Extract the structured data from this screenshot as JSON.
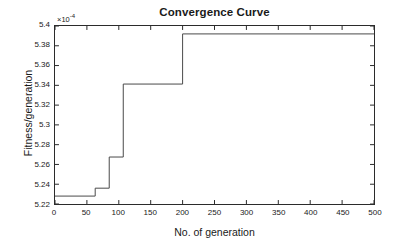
{
  "chart_data": {
    "type": "line",
    "variant": "step-post",
    "title": "Convergence Curve",
    "xlabel": "No. of generation",
    "ylabel": "Fitness/generation",
    "exponent_label": "×10",
    "exponent_power": "-4",
    "y_scale_factor": 0.0001,
    "xlim": [
      0,
      500
    ],
    "ylim": [
      5.22,
      5.4
    ],
    "grid": false,
    "legend": null,
    "line_color": "#4a4a4a",
    "xticks": [
      0,
      50,
      100,
      150,
      200,
      250,
      300,
      350,
      400,
      450,
      500
    ],
    "xtick_labels": [
      "0",
      "50",
      "100",
      "150",
      "200",
      "250",
      "300",
      "350",
      "400",
      "450",
      "500"
    ],
    "yticks": [
      5.22,
      5.24,
      5.26,
      5.28,
      5.3,
      5.32,
      5.34,
      5.36,
      5.38,
      5.4
    ],
    "ytick_labels": [
      "5.22",
      "5.24",
      "5.26",
      "5.28",
      "5.3",
      "5.32",
      "5.34",
      "5.36",
      "5.38",
      "5.4"
    ],
    "x": [
      0,
      63,
      63,
      85,
      85,
      107,
      107,
      200,
      200,
      500
    ],
    "y": [
      5.228,
      5.228,
      5.236,
      5.236,
      5.2675,
      5.2675,
      5.3413,
      5.3413,
      5.392,
      5.392
    ],
    "steps": [
      {
        "generation": 0,
        "fitness": 5.228
      },
      {
        "generation": 63,
        "fitness": 5.236
      },
      {
        "generation": 85,
        "fitness": 5.2675
      },
      {
        "generation": 107,
        "fitness": 5.3413
      },
      {
        "generation": 200,
        "fitness": 5.392
      },
      {
        "generation": 500,
        "fitness": 5.392
      }
    ]
  }
}
